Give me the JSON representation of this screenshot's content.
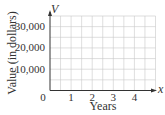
{
  "chart_data": {
    "type": "line",
    "title": "",
    "xlabel": "Years",
    "ylabel": "Value (in dollars)",
    "x_axis_variable": "x",
    "y_axis_variable": "V",
    "x_ticks": [
      "0",
      "1",
      "2",
      "3",
      "4"
    ],
    "y_ticks": [
      "10,000",
      "20,000",
      "30,000"
    ],
    "xlim": [
      0,
      5
    ],
    "ylim": [
      0,
      35000
    ],
    "grid": true,
    "grid_x_step": 0.5,
    "grid_y_step": 5000,
    "series": []
  },
  "colors": {
    "axis": "#333333",
    "grid": "#c8c8c8",
    "text": "#333333"
  }
}
